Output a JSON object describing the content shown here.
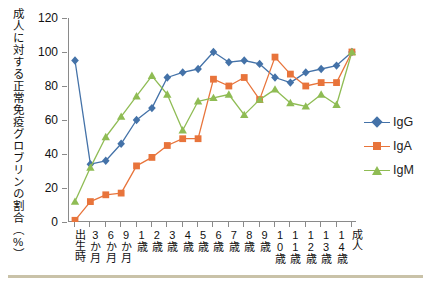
{
  "chart_data": {
    "type": "line",
    "title": "",
    "xlabel": "",
    "ylabel": "成人に対する正常免疫グロブリンの割合（%）",
    "ylim": [
      0,
      120
    ],
    "ytick_labels": [
      "0",
      "20",
      "40",
      "60",
      "80",
      "100",
      "120"
    ],
    "ytick_values": [
      0,
      20,
      40,
      60,
      80,
      100,
      120
    ],
    "grid": false,
    "legend_position": "right",
    "categories": [
      "出生時",
      "3か月",
      "6か月",
      "9か月",
      "1歳",
      "2歳",
      "3歳",
      "4歳",
      "5歳",
      "6歳",
      "7歳",
      "8歳",
      "9歳",
      "10歳",
      "11歳",
      "12歳",
      "13歳",
      "14歳",
      "成人"
    ],
    "series": [
      {
        "name": "IgG",
        "color": "#4472a8",
        "marker": "diamond",
        "values": [
          95,
          34,
          36,
          46,
          60,
          67,
          85,
          88,
          90,
          100,
          94,
          95,
          93,
          85,
          82,
          88,
          90,
          92,
          100
        ]
      },
      {
        "name": "IgA",
        "color": "#e8743b",
        "marker": "square",
        "values": [
          1,
          12,
          16,
          17,
          33,
          38,
          45,
          49,
          49,
          84,
          80,
          85,
          72,
          97,
          87,
          80,
          82,
          82,
          100
        ]
      },
      {
        "name": "IgM",
        "color": "#8fbc54",
        "marker": "triangle",
        "values": [
          12,
          32,
          50,
          62,
          74,
          86,
          75,
          54,
          71,
          73,
          75,
          63,
          72,
          78,
          70,
          68,
          75,
          69,
          100
        ]
      }
    ]
  },
  "legend": {
    "entries": [
      {
        "label": "IgG"
      },
      {
        "label": "IgA"
      },
      {
        "label": "IgM"
      }
    ]
  }
}
